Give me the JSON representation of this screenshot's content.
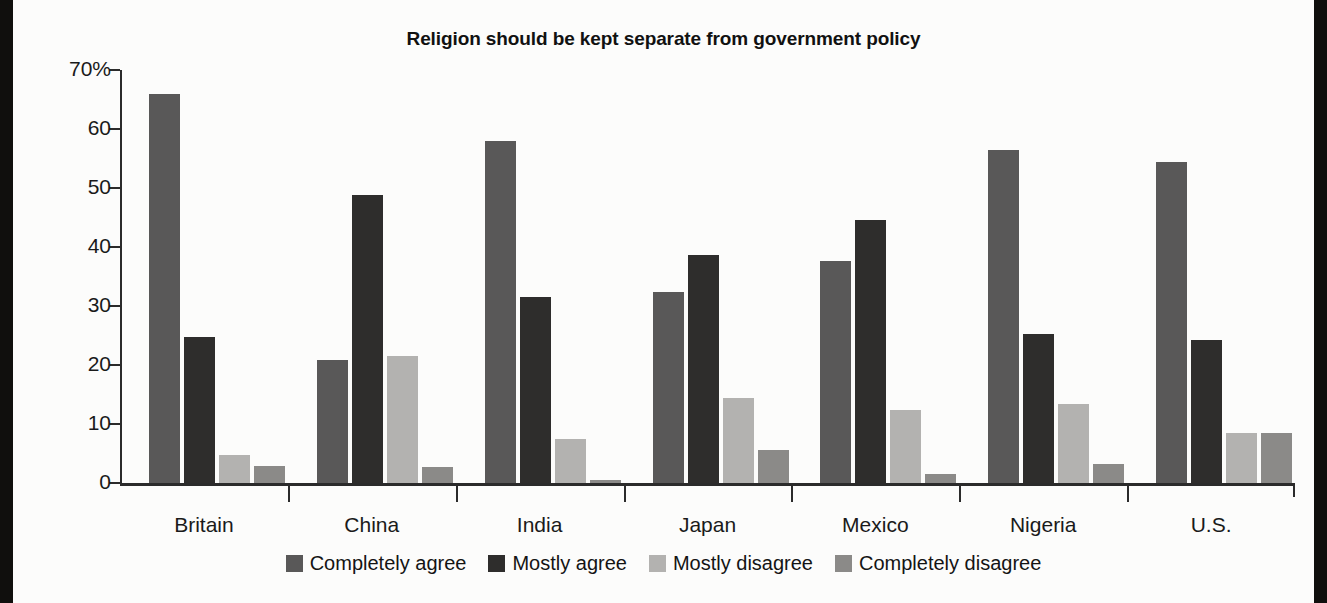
{
  "chart_data": {
    "type": "bar",
    "title": "Religion should be kept separate from government policy",
    "xlabel": "",
    "ylabel": "",
    "ylim": [
      0,
      70
    ],
    "yticks": [
      0,
      10,
      20,
      30,
      40,
      50,
      60,
      70
    ],
    "ytick_labels": [
      "0",
      "10",
      "20",
      "30",
      "40",
      "50",
      "60",
      "70%"
    ],
    "grid": false,
    "legend_position": "bottom",
    "categories": [
      "Britain",
      "China",
      "India",
      "Japan",
      "Mexico",
      "Nigeria",
      "U.S."
    ],
    "series": [
      {
        "name": "Completely agree",
        "color": "#595858",
        "values": [
          65.9,
          20.8,
          57.9,
          32.4,
          37.6,
          56.4,
          54.4
        ]
      },
      {
        "name": "Mostly agree",
        "color": "#2e2d2c",
        "values": [
          24.8,
          48.8,
          31.5,
          38.6,
          44.5,
          25.2,
          24.2
        ]
      },
      {
        "name": "Mostly disagree",
        "color": "#b3b2b0",
        "values": [
          4.8,
          21.6,
          7.5,
          14.4,
          12.4,
          13.4,
          8.4
        ]
      },
      {
        "name": "Completely disagree",
        "color": "#8b8a88",
        "values": [
          2.9,
          2.7,
          0.5,
          5.6,
          1.6,
          3.3,
          8.4
        ]
      }
    ]
  }
}
